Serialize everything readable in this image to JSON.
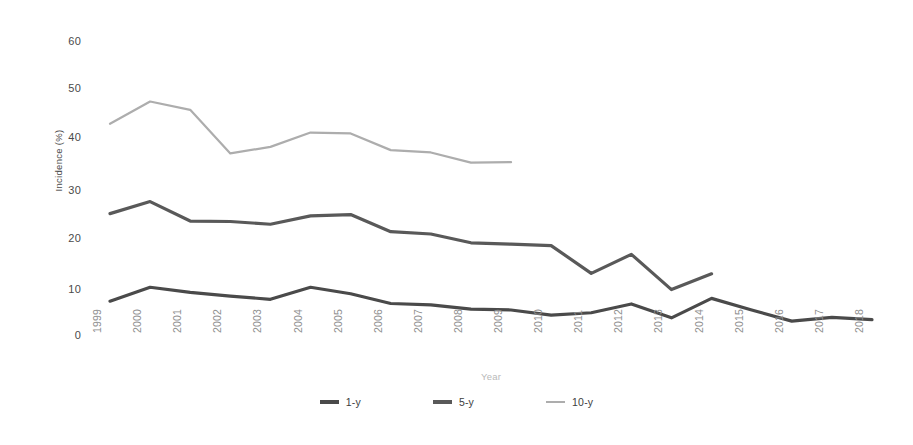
{
  "chart_data": {
    "type": "line",
    "title": "",
    "subtitle": "",
    "xlabel": "Year",
    "ylabel": "Incidence (%)",
    "grid": false,
    "legend_position": "bottom-center",
    "ylim": [
      0,
      60
    ],
    "yticks": [
      60,
      50,
      40,
      30,
      20,
      10,
      0
    ],
    "categories": [
      "1999",
      "2000",
      "2001",
      "2002",
      "2003",
      "2004",
      "2005",
      "2006",
      "2007",
      "2008",
      "2009",
      "2010",
      "2011",
      "2012",
      "2013",
      "2014",
      "2015",
      "2016",
      "2017",
      "2018"
    ],
    "series": [
      {
        "name": "1-y",
        "color": "#4a4a4a",
        "values": [
          7.3,
          10.3,
          9.2,
          8.4,
          7.7,
          10.3,
          8.9,
          6.8,
          6.5,
          5.6,
          5.4,
          4.3,
          4.8,
          6.7,
          3.7,
          7.9,
          5.4,
          3.0,
          3.8,
          3.3
        ]
      },
      {
        "name": "5-y",
        "color": "#595959",
        "values": [
          26.2,
          28.8,
          24.6,
          24.5,
          23.9,
          25.7,
          26.0,
          22.3,
          21.8,
          19.9,
          19.6,
          19.3,
          13.3,
          17.4,
          9.8,
          13.2,
          null,
          null,
          null,
          null
        ]
      },
      {
        "name": "10-y",
        "color": "#adadad",
        "values": [
          45.6,
          50.4,
          48.6,
          39.2,
          40.6,
          43.7,
          43.5,
          39.9,
          39.4,
          37.2,
          37.3,
          null,
          null,
          null,
          null,
          null,
          null,
          null,
          null,
          null
        ]
      }
    ]
  },
  "legend": {
    "items": [
      {
        "label": "1-y",
        "color": "#4a4a4a",
        "thickness": 3.4
      },
      {
        "label": "5-y",
        "color": "#595959",
        "thickness": 3.4
      },
      {
        "label": "10-y",
        "color": "#adadad",
        "thickness": 2.2
      }
    ]
  },
  "footnote": {
    "text": ""
  }
}
